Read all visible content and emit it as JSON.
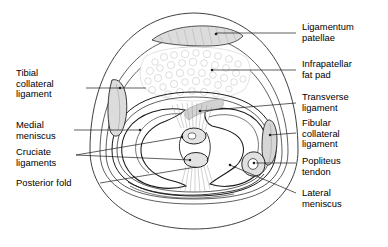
{
  "figure": {
    "type": "anatomical-diagram",
    "background": "#ffffff",
    "line_color": "#1a1a1a",
    "fill_gray": "#d9d9d9",
    "stipple_gray": "#b9b9b9"
  },
  "labels": {
    "left": [
      {
        "id": "tibial-collateral-ligament",
        "text": "Tibial\ncollateral\nligament",
        "x": 16,
        "y": 68,
        "leader": {
          "x1": 86,
          "y1": 88,
          "x2": 146,
          "y2": 88
        }
      },
      {
        "id": "medial-meniscus",
        "text": "Medial\nmeniscus",
        "x": 16,
        "y": 120,
        "leader": {
          "x1": 74,
          "y1": 130,
          "x2": 140,
          "y2": 130
        }
      },
      {
        "id": "cruciate-ligaments",
        "text": "Cruciate\nligaments",
        "x": 16,
        "y": 147,
        "leader": {
          "x1": 76,
          "y1": 155,
          "x2": 182,
          "y2": 140
        }
      },
      {
        "id": "posterior-fold",
        "text": "Posterior fold",
        "x": 16,
        "y": 179,
        "leader": {
          "x1": 100,
          "y1": 183,
          "x2": 196,
          "y2": 170
        }
      }
    ],
    "right": [
      {
        "id": "ligamentum-patellae",
        "text": "Ligamentum\npatellae",
        "x": 302,
        "y": 22,
        "leader": {
          "x1": 296,
          "y1": 33,
          "x2": 222,
          "y2": 33
        }
      },
      {
        "id": "infrapatellar-fat-pad",
        "text": "Infrapatellar\nfat pad",
        "x": 302,
        "y": 59,
        "leader": {
          "x1": 296,
          "y1": 70,
          "x2": 220,
          "y2": 70
        }
      },
      {
        "id": "transverse-ligament",
        "text": "Transverse\nligament",
        "x": 302,
        "y": 92,
        "leader": {
          "x1": 296,
          "y1": 103,
          "x2": 196,
          "y2": 112
        }
      },
      {
        "id": "fibular-collateral-ligament",
        "text": "Fibular\ncollateral\nligament",
        "x": 302,
        "y": 118,
        "leader": {
          "x1": 296,
          "y1": 133,
          "x2": 265,
          "y2": 133
        }
      },
      {
        "id": "popliteus-tendon",
        "text": "Popliteus\ntendon",
        "x": 302,
        "y": 156,
        "leader": {
          "x1": 296,
          "y1": 163,
          "x2": 258,
          "y2": 160
        }
      },
      {
        "id": "lateral-meniscus",
        "text": "Lateral\nmeniscus",
        "x": 302,
        "y": 189,
        "leader": {
          "x1": 296,
          "y1": 193,
          "x2": 233,
          "y2": 166
        }
      }
    ]
  }
}
